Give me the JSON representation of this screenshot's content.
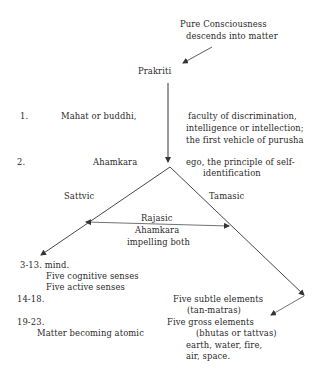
{
  "diagram": {
    "top": {
      "line1": "Pure Consciousness",
      "line2": "descends into matter"
    },
    "root": "Prakriti",
    "stage1": {
      "number": "1.",
      "name": "Mahat or buddhi,",
      "desc1": "faculty of discrimination,",
      "desc2": "intelligence or intellection;",
      "desc3": "the first vehicle of purusha"
    },
    "stage2": {
      "number": "2.",
      "name": "Ahamkara",
      "desc1": "ego, the principle of self-",
      "desc2": "identification"
    },
    "branches": {
      "left": "Sattvic",
      "right": "Tamasic",
      "middle1": "Rajasic",
      "middle2": "Ahamkara",
      "middle3": "impelling both"
    },
    "left_outputs": {
      "range1": "3-13. mind.",
      "item1": "Five cognitive senses",
      "item2": "Five active senses",
      "range2": "14-18.",
      "range3": "19-23.",
      "item3": "Matter becoming atomic"
    },
    "right_outputs": {
      "subtle1": "Five subtle elements",
      "subtle2": "(tan-matras)",
      "gross1": "Five gross elements",
      "gross2": "(bhutas or tattvas)",
      "gross3": "earth, water, fire,",
      "gross4": "air, space."
    },
    "colors": {
      "text": "#2a2a2a",
      "lines": "#333333",
      "background": "#ffffff"
    }
  }
}
